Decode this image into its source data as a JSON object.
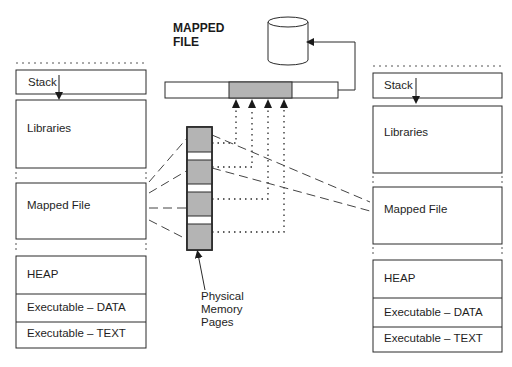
{
  "title": {
    "line1": "MAPPED",
    "line2": "FILE"
  },
  "physical_memory_label": {
    "line1": "Physical",
    "line2": "Memory",
    "line3": "Pages"
  },
  "left_process": {
    "segments": [
      {
        "label": "Stack"
      },
      {
        "label": "Libraries"
      },
      {
        "label": "Mapped File"
      },
      {
        "label": "HEAP"
      },
      {
        "label": "Executable – DATA"
      },
      {
        "label": "Executable – TEXT"
      }
    ]
  },
  "right_process": {
    "segments": [
      {
        "label": "Stack"
      },
      {
        "label": "Libraries"
      },
      {
        "label": "Mapped File"
      },
      {
        "label": "HEAP"
      },
      {
        "label": "Executable – DATA"
      },
      {
        "label": "Executable – TEXT"
      }
    ]
  },
  "colors": {
    "page_fill": "#b4b4b4",
    "line": "#2a2a2a",
    "background": "#ffffff"
  },
  "physical_pages_count": 4,
  "mapped_region_arrows": 4
}
